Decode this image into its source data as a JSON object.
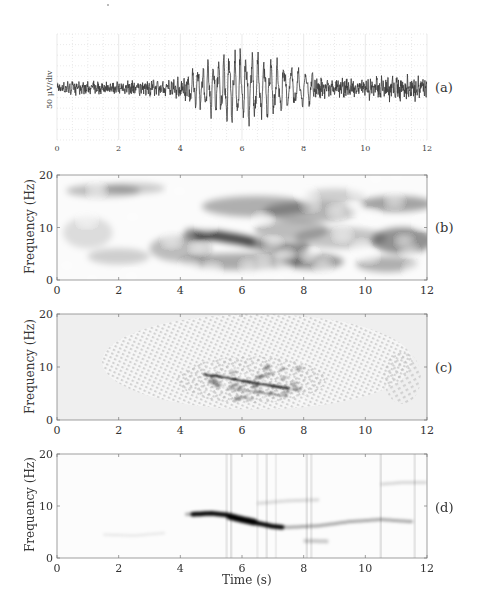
{
  "chart_data": [
    {
      "panel": "(a)",
      "type": "line",
      "title": "",
      "xlabel": "",
      "ylabel": "50 μV/div",
      "xlim": [
        0,
        12
      ],
      "xticks": [
        "0",
        "2",
        "4",
        "6",
        "8",
        "10",
        "12"
      ],
      "grid": true,
      "description": "Raw EEG-like trace; small-amplitude noisy oscillation until ~4.3 s, a large-amplitude burst (~6-8 Hz, chirping down) from ~4.5 s to ~8 s peaking near 5.5-6.5 s, then moderate-amplitude noisy oscillation to 12 s.",
      "envelope": {
        "t": [
          0,
          2,
          3.5,
          4.5,
          5.0,
          5.5,
          6.0,
          6.5,
          7.0,
          7.5,
          8.0,
          9.0,
          10.0,
          11.0,
          12.0
        ],
        "amplitude_div": [
          0.6,
          0.6,
          0.8,
          1.3,
          1.9,
          2.4,
          2.4,
          2.3,
          1.9,
          1.5,
          1.2,
          0.8,
          0.9,
          1.2,
          1.1
        ]
      },
      "burst_frequency_hz": {
        "t": [
          4.5,
          5.5,
          6.5,
          7.5,
          8.0
        ],
        "f": [
          8.5,
          8.0,
          7.0,
          6.0,
          5.8
        ]
      }
    },
    {
      "panel": "(b)",
      "type": "heatmap",
      "ylabel": "Frequency (Hz)",
      "xlabel": "",
      "xlim": [
        0,
        12
      ],
      "ylim": [
        0,
        20
      ],
      "xticks": [
        "0",
        "2",
        "4",
        "6",
        "8",
        "10",
        "12"
      ],
      "yticks": [
        "0",
        "10",
        "20"
      ],
      "description": "Smooth, blurry spectrogram; dark ridge from ~(4.5 s, 8.5 Hz) descending to ~(7.5 s, 6 Hz); diffuse energy around 14 Hz at 5-9 s and 10-12 s, 3-5 Hz at 5-9 s, faint band at 17 Hz for 1-3 s.",
      "ridge": {
        "t": [
          4.3,
          5.0,
          5.5,
          6.0,
          6.5,
          7.0,
          7.5,
          8.0
        ],
        "f": [
          8.7,
          8.6,
          8.1,
          7.6,
          6.9,
          6.3,
          6.0,
          6.0
        ]
      }
    },
    {
      "panel": "(c)",
      "type": "heatmap",
      "ylabel": "Frequency (Hz)",
      "xlabel": "",
      "xlim": [
        0,
        12
      ],
      "ylim": [
        0,
        20
      ],
      "xticks": [
        "0",
        "2",
        "4",
        "6",
        "8",
        "10",
        "12"
      ],
      "yticks": [
        "0",
        "10",
        "20"
      ],
      "description": "Wigner-Ville-like distribution with dense interference (cross-term) fringes; sharp dark chirp line from ~(5 s, 8.5 Hz) to ~(7.5 s, 6 Hz); oscillatory artifacts between 4 and 12 s.",
      "ridge": {
        "t": [
          4.8,
          5.5,
          6.0,
          6.5,
          7.0,
          7.5
        ],
        "f": [
          8.6,
          8.0,
          7.4,
          6.9,
          6.4,
          6.0
        ]
      }
    },
    {
      "panel": "(d)",
      "type": "heatmap",
      "ylabel": "Frequency (Hz)",
      "xlabel": "Time (s)",
      "xlim": [
        0,
        12
      ],
      "ylim": [
        0,
        20
      ],
      "xticks": [
        "0",
        "2",
        "4",
        "6",
        "8",
        "10",
        "12"
      ],
      "yticks": [
        "0",
        "10",
        "20"
      ],
      "description": "Sharpened / reassigned time-frequency representation; clean dark ridge from ~(4.2 s, 8.5 Hz) through (6 s, 7.5 Hz) to (7.3 s, 6 Hz), continuing faintly to ~(10.5 s, 7.5 Hz); faint line at 14.5 Hz from 10.5-12 s; faint vertical streaks near 5.5, 6.5, 7 and 8 s.",
      "ridge": {
        "t": [
          4.2,
          5.0,
          5.5,
          6.0,
          6.5,
          7.0,
          7.5,
          8.5,
          9.5,
          10.5,
          11.5
        ],
        "f": [
          8.4,
          8.6,
          8.3,
          7.5,
          6.7,
          6.1,
          5.9,
          6.2,
          7.0,
          7.4,
          7.0
        ]
      }
    }
  ],
  "panels": {
    "a": {
      "label": "(a)",
      "ylabel": "50 μV/div"
    },
    "b": {
      "label": "(b)",
      "ylabel": "Frequency (Hz)"
    },
    "c": {
      "label": "(c)",
      "ylabel": "Frequency (Hz)"
    },
    "d": {
      "label": "(d)",
      "ylabel": "Frequency (Hz)",
      "xlabel": "Time (s)"
    }
  },
  "axes": {
    "xticks": [
      "0",
      "2",
      "4",
      "6",
      "8",
      "10",
      "12"
    ],
    "yticks": [
      "0",
      "10",
      "20"
    ]
  },
  "style": {
    "trace_color": "#3a3a3a",
    "grid_color": "#d8d8d8",
    "frame_color": "#888888",
    "ink_color": "#111111"
  }
}
